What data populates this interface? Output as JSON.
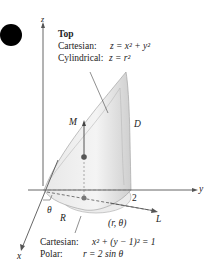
{
  "figure": {
    "marker": "black-circle",
    "axes": {
      "z": "z",
      "y": "y",
      "x": "x"
    },
    "top_caption": {
      "title": "Top",
      "cartesian_label": "Cartesian:",
      "cartesian_eq": "z = x² + y²",
      "cylindrical_label": "Cylindrical:",
      "cylindrical_eq": "z = r²"
    },
    "labels": {
      "M": "M",
      "D": "D",
      "two": "2",
      "theta": "θ",
      "R": "R",
      "point": "(r, θ)",
      "L": "L"
    },
    "bottom_caption": {
      "cartesian_label": "Cartesian:",
      "cartesian_eq": "x² + (y − 1)² = 1",
      "polar_label": "Polar:",
      "polar_eq": "r = 2 sin θ"
    }
  }
}
